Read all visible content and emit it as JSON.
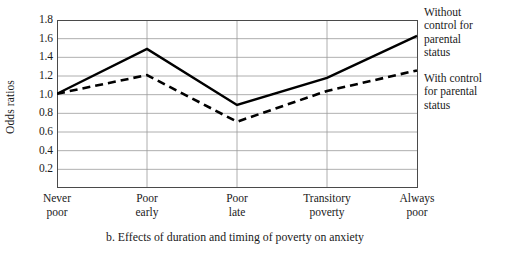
{
  "chart_data": {
    "type": "line",
    "title": "",
    "caption": "b. Effects of duration and timing of poverty on anxiety",
    "xlabel": "",
    "ylabel": "Odds ratios",
    "categories": [
      "Never poor",
      "Poor early",
      "Poor late",
      "Transitory poverty",
      "Always poor"
    ],
    "category_lines": [
      [
        "Never",
        "poor"
      ],
      [
        "Poor",
        "early"
      ],
      [
        "Poor",
        "late"
      ],
      [
        "Transitory",
        "poverty"
      ],
      [
        "Always",
        "poor"
      ]
    ],
    "series": [
      {
        "name": "Without control for parental status",
        "name_lines": [
          "Without",
          "control for",
          "parental",
          "status"
        ],
        "style": "solid",
        "color": "#000000",
        "values": [
          1.01,
          1.49,
          0.89,
          1.18,
          1.63
        ]
      },
      {
        "name": "With control for parental status",
        "name_lines": [
          "With control",
          "for parental",
          "status"
        ],
        "style": "dashed",
        "color": "#000000",
        "values": [
          1.01,
          1.21,
          0.71,
          1.04,
          1.26
        ]
      }
    ],
    "ylim": [
      0.0,
      1.8
    ],
    "yticks": [
      "1.8",
      "1.6",
      "1.4",
      "1.2",
      "1.0",
      "0.8",
      "0.6",
      "0.4",
      "0.2"
    ],
    "ytick_values": [
      1.8,
      1.6,
      1.4,
      1.2,
      1.0,
      0.8,
      0.6,
      0.4,
      0.2
    ],
    "grid": {
      "horizontal": true,
      "vertical": true
    },
    "legend_position": "right"
  }
}
